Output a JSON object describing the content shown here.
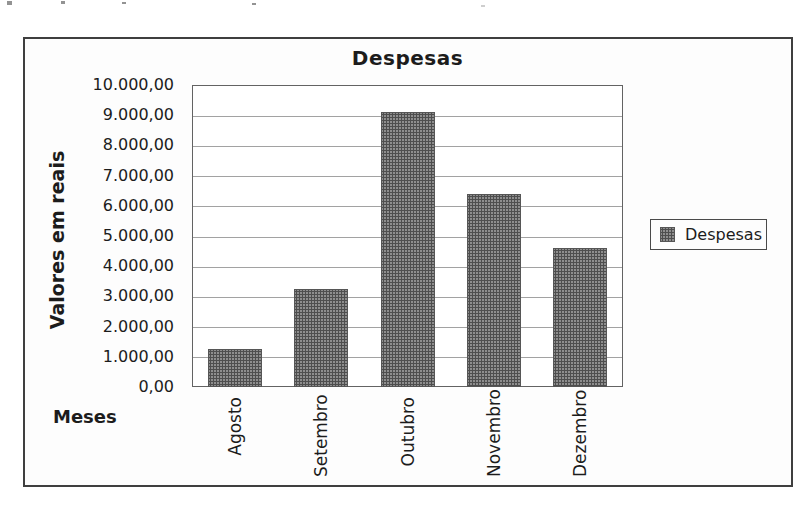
{
  "chart_data": {
    "type": "bar",
    "title": "Despesas",
    "xlabel": "Meses",
    "ylabel": "Valores em reais",
    "categories": [
      "Agosto",
      "Setembro",
      "Outubro",
      "Novembro",
      "Dezembro"
    ],
    "series": [
      {
        "name": "Despesas",
        "values": [
          1250,
          3250,
          9100,
          6400,
          4600
        ]
      }
    ],
    "ylim": [
      0,
      10000
    ],
    "ytick_step": 1000,
    "ytick_labels": [
      "0,00",
      "1.000,00",
      "2.000,00",
      "3.000,00",
      "4.000,00",
      "5.000,00",
      "6.000,00",
      "7.000,00",
      "8.000,00",
      "9.000,00",
      "10.000,00"
    ],
    "grid": true,
    "legend": {
      "position": "right",
      "entries": [
        {
          "label": "Despesas",
          "color": "#777777"
        }
      ]
    },
    "bar_color": "#777777"
  }
}
